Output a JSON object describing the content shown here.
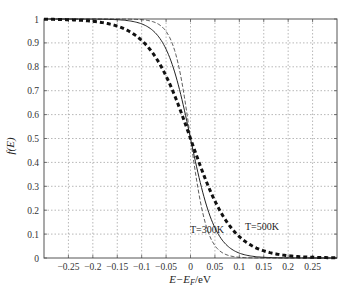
{
  "chart_data": {
    "type": "line",
    "title": "",
    "xlabel": "E−E_F/eV",
    "ylabel": "f(E)",
    "xlim": [
      -0.3,
      0.3
    ],
    "ylim": [
      0,
      1
    ],
    "grid": true,
    "x_ticks": [
      "-0.25",
      "-0.2",
      "-0.15",
      "-0.1",
      "-0.05",
      "0",
      "0.05",
      "0.1",
      "0.15",
      "0.2",
      "0.25"
    ],
    "x_tick_values": [
      -0.25,
      -0.2,
      -0.15,
      -0.1,
      -0.05,
      0,
      0.05,
      0.1,
      0.15,
      0.2,
      0.25
    ],
    "y_ticks": [
      "0",
      "0.1",
      "0.2",
      "0.3",
      "0.4",
      "0.5",
      "0.6",
      "0.7",
      "0.8",
      "0.9",
      "1"
    ],
    "y_tick_values": [
      0,
      0.1,
      0.2,
      0.3,
      0.4,
      0.5,
      0.6,
      0.7,
      0.8,
      0.9,
      1
    ],
    "series": [
      {
        "name": "thin dashed (lower T)",
        "style": "thin-dashed",
        "kT": 0.0172,
        "x": [
          -0.3,
          -0.2,
          -0.15,
          -0.1,
          -0.05,
          0,
          0.05,
          0.1,
          0.15,
          0.2,
          0.3
        ],
        "values": [
          1.0,
          1.0,
          1.0,
          1.0,
          0.95,
          0.5,
          0.05,
          0.003,
          0.0,
          0.0,
          0.0
        ]
      },
      {
        "name": "T=300K",
        "style": "solid",
        "kT": 0.02585,
        "x": [
          -0.3,
          -0.2,
          -0.15,
          -0.1,
          -0.05,
          0,
          0.05,
          0.1,
          0.15,
          0.2,
          0.3
        ],
        "values": [
          1.0,
          1.0,
          1.0,
          0.98,
          0.87,
          0.5,
          0.13,
          0.02,
          0.003,
          0.0,
          0.0
        ]
      },
      {
        "name": "T=500K",
        "style": "thick-dashed",
        "kT": 0.0431,
        "x": [
          -0.3,
          -0.2,
          -0.15,
          -0.1,
          -0.05,
          0,
          0.05,
          0.1,
          0.15,
          0.2,
          0.3
        ],
        "values": [
          1.0,
          0.99,
          0.97,
          0.91,
          0.76,
          0.5,
          0.24,
          0.09,
          0.03,
          0.01,
          0.0
        ]
      }
    ],
    "annotations": [
      {
        "text": "T=300K",
        "x": 0.025,
        "y": 0.1
      },
      {
        "text": "T=500K",
        "x": 0.1,
        "y": 0.13
      }
    ]
  },
  "labels": {
    "ylabel": "f(E)",
    "xlabel": "E−E",
    "xlabel_sub": "F",
    "xlabel_unit": "/eV",
    "annot_300": "T=300K",
    "annot_500": "T=500K"
  }
}
